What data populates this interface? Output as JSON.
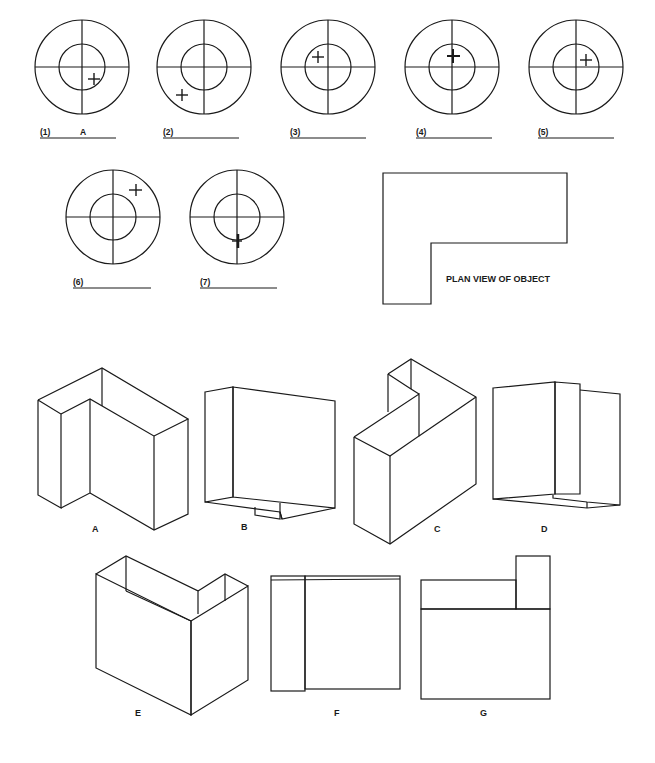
{
  "targets": [
    {
      "number": "(1)",
      "answer": "A",
      "mark": {
        "dx": 12,
        "dy": 12
      }
    },
    {
      "number": "(2)",
      "answer": "",
      "mark": {
        "dx": -22,
        "dy": 28
      }
    },
    {
      "number": "(3)",
      "answer": "",
      "mark": {
        "dx": -10,
        "dy": -10
      }
    },
    {
      "number": "(4)",
      "answer": "",
      "mark": {
        "dx": 1,
        "dy": -11
      }
    },
    {
      "number": "(5)",
      "answer": "",
      "mark": {
        "dx": 10,
        "dy": -7
      }
    },
    {
      "number": "(6)",
      "answer": "",
      "mark": {
        "dx": 23,
        "dy": -26
      }
    },
    {
      "number": "(7)",
      "answer": "",
      "mark": {
        "dx": 0,
        "dy": 24
      }
    }
  ],
  "plan_view": {
    "label": "PLAN VIEW OF OBJECT"
  },
  "views": [
    {
      "letter": "A"
    },
    {
      "letter": "B"
    },
    {
      "letter": "C"
    },
    {
      "letter": "D"
    },
    {
      "letter": "E"
    },
    {
      "letter": "F"
    },
    {
      "letter": "G"
    }
  ]
}
